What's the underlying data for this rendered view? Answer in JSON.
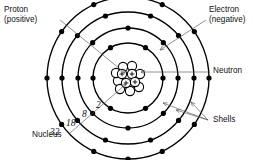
{
  "diagram": {
    "center": {
      "x": 128,
      "y": 78
    },
    "background": "#ffffff",
    "stroke_color": "#000000",
    "leader_color": "#555555"
  },
  "labels": {
    "proton": {
      "line1": "Proton",
      "line2": "(positive)",
      "x": 4,
      "y": 12
    },
    "electron": {
      "line1": "Electron",
      "line2": "(negative)",
      "x": 209,
      "y": 12
    },
    "neutron": {
      "text": "Neutron",
      "x": 213,
      "y": 73
    },
    "shells": {
      "text": "Shells",
      "x": 213,
      "y": 122
    },
    "nucleus": {
      "text": "Nucleus",
      "x": 32,
      "y": 137
    }
  },
  "shell_counts": [
    {
      "value": "2",
      "x": 96,
      "y": 108
    },
    {
      "value": "8",
      "x": 82,
      "y": 117
    },
    {
      "value": "18",
      "x": 66,
      "y": 126
    },
    {
      "value": "32",
      "x": 50,
      "y": 135
    }
  ],
  "shells": [
    {
      "name": "shell-1",
      "capacity": 2,
      "radius": 35
    },
    {
      "name": "shell-2",
      "capacity": 8,
      "radius": 50
    },
    {
      "name": "shell-3",
      "capacity": 18,
      "radius": 66
    },
    {
      "name": "shell-4",
      "capacity": 32,
      "radius": 81
    }
  ],
  "electrons": {
    "dot_radius": 2.6,
    "color": "#000000",
    "rings": [
      {
        "radius": 35,
        "angles": [
          0,
          60,
          120,
          180,
          240,
          300
        ]
      },
      {
        "radius": 50,
        "angles": [
          0,
          45,
          90,
          135,
          180,
          225,
          270,
          315
        ]
      },
      {
        "radius": 66,
        "angles": [
          0,
          40,
          70,
          110,
          140,
          180,
          220,
          250,
          290,
          320
        ]
      },
      {
        "radius": 81,
        "angles": [
          0,
          35,
          65,
          90,
          115,
          145,
          180,
          215,
          245,
          270,
          295,
          325
        ]
      }
    ]
  },
  "nucleus": {
    "particle_radius": 4.6,
    "protons": [
      {
        "x": -6,
        "y": -4
      },
      {
        "x": 4,
        "y": -4
      },
      {
        "x": -2,
        "y": 5
      },
      {
        "x": 7,
        "y": 4
      }
    ],
    "neutrons": [
      {
        "x": -10,
        "y": 3
      },
      {
        "x": -5,
        "y": -11
      },
      {
        "x": 4,
        "y": -12
      },
      {
        "x": 12,
        "y": -4
      },
      {
        "x": -8,
        "y": 11
      },
      {
        "x": 2,
        "y": 13
      },
      {
        "x": 11,
        "y": 9
      },
      {
        "x": -12,
        "y": -5
      }
    ],
    "proton_symbol": "+"
  },
  "leaders": {
    "proton": {
      "from": [
        60,
        20
      ],
      "to": [
        125,
        73
      ]
    },
    "electron": {
      "from": [
        206,
        20
      ],
      "to": [
        160,
        50
      ]
    },
    "neutron": {
      "from": [
        210,
        72
      ],
      "to": [
        141,
        72
      ]
    },
    "nucleus": {
      "from": [
        70,
        133
      ],
      "to": [
        126,
        84
      ]
    },
    "shells": [
      {
        "from": [
          208,
          120
        ],
        "to": [
          163,
          103
        ]
      },
      {
        "from": [
          208,
          120
        ],
        "to": [
          176,
          110
        ]
      },
      {
        "from": [
          208,
          120
        ],
        "to": [
          191,
          102
        ]
      }
    ]
  }
}
